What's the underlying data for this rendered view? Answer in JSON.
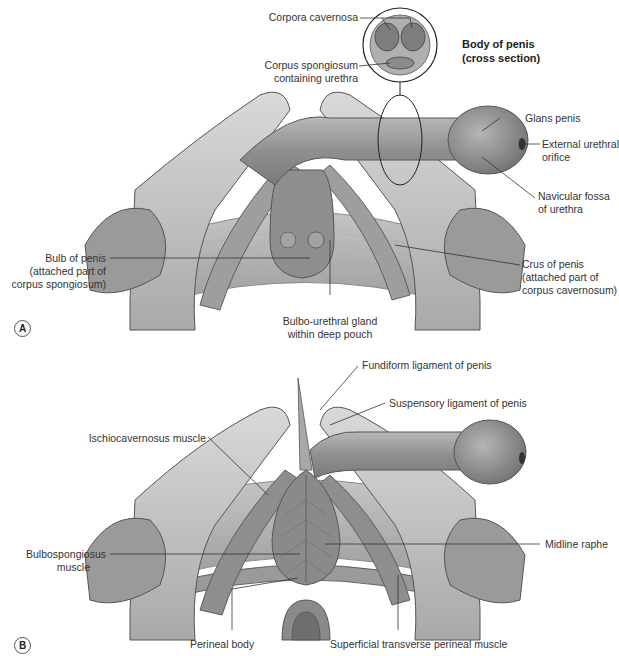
{
  "figure": {
    "panel_a": {
      "marker": "A",
      "inset": {
        "title_line1": "Body of penis",
        "title_line2": "(cross section)",
        "labels": {
          "corpora_cavernosa": "Corpora cavernosa",
          "corpus_spongiosum_line1": "Corpus spongiosum",
          "corpus_spongiosum_line2": "containing urethra"
        }
      },
      "labels": {
        "glans_penis": "Glans penis",
        "external_urethral_orifice_line1": "External urethral",
        "external_urethral_orifice_line2": "orifice",
        "navicular_fossa_line1": "Navicular fossa",
        "navicular_fossa_line2": "of urethra",
        "crus_line1": "Crus of penis",
        "crus_line2": "(attached part of",
        "crus_line3": "corpus cavernosum)",
        "bulb_line1": "Bulb of penis",
        "bulb_line2": "(attached part of",
        "bulb_line3": "corpus spongiosum)",
        "bulbourethral_line1": "Bulbo-urethral gland",
        "bulbourethral_line2": "within deep pouch"
      }
    },
    "panel_b": {
      "marker": "B",
      "labels": {
        "fundiform": "Fundiform ligament of penis",
        "suspensory": "Suspensory ligament of penis",
        "ischiocavernosus": "Ischiocavernosus muscle",
        "bulbospongiosus_line1": "Bulbospongiosus",
        "bulbospongiosus_line2": "muscle",
        "midline_raphe": "Midline raphe",
        "perineal_body": "Perineal body",
        "superficial_transverse": "Superficial transverse perineal muscle"
      }
    }
  }
}
